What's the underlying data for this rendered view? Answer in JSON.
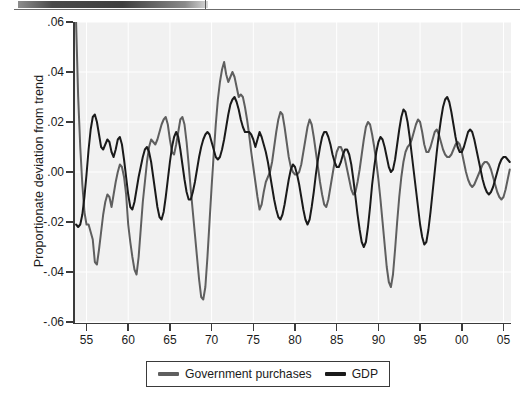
{
  "figure": {
    "ylabel": "Proportionate deviation from trend",
    "plot_bg": "#f1f1f1",
    "gridline_color": "#ffffff",
    "axis_color": "#3a3a3a"
  },
  "legend": {
    "items": [
      {
        "label": "Government purchases",
        "color": "#5f5f5f",
        "swatch_name": "legend-swatch-government-purchases"
      },
      {
        "label": "GDP",
        "color": "#1a1a1a",
        "swatch_name": "legend-swatch-gdp"
      }
    ]
  },
  "chart_data": {
    "type": "line",
    "title": "",
    "subtitle": "",
    "xlabel": "",
    "ylabel": "Proportionate deviation from trend",
    "xlim": [
      1953.5,
      2005.9
    ],
    "ylim": [
      -0.06,
      0.06
    ],
    "grid": true,
    "legend_position": "bottom-center",
    "xtick_labels": [
      "55",
      "60",
      "65",
      "70",
      "75",
      "80",
      "85",
      "90",
      "95",
      "00",
      "05"
    ],
    "xtick_values": [
      1955,
      1960,
      1965,
      1970,
      1975,
      1980,
      1985,
      1990,
      1995,
      2000,
      2005
    ],
    "ytick_labels": [
      ".06",
      ".04",
      ".02",
      ".00",
      "-.02",
      "-.04",
      "-.06"
    ],
    "ytick_values": [
      0.06,
      0.04,
      0.02,
      0.0,
      -0.02,
      -0.04,
      -0.06
    ],
    "x_start": 1953.75,
    "x_step": 0.25,
    "series": [
      {
        "name": "Government purchases",
        "color": "#5f5f5f",
        "linewidth": 2.0,
        "values": [
          0.06,
          0.03,
          0.01,
          -0.005,
          -0.016,
          -0.021,
          -0.021,
          -0.024,
          -0.027,
          -0.036,
          -0.037,
          -0.031,
          -0.024,
          -0.017,
          -0.012,
          -0.009,
          -0.01,
          -0.014,
          -0.009,
          -0.004,
          0.0,
          0.003,
          0.002,
          -0.002,
          -0.009,
          -0.021,
          -0.028,
          -0.034,
          -0.039,
          -0.041,
          -0.034,
          -0.023,
          -0.012,
          -0.004,
          0.004,
          0.01,
          0.013,
          0.012,
          0.011,
          0.013,
          0.016,
          0.019,
          0.021,
          0.022,
          0.019,
          0.013,
          0.008,
          0.007,
          0.011,
          0.016,
          0.021,
          0.022,
          0.019,
          0.012,
          0.003,
          -0.007,
          -0.016,
          -0.025,
          -0.034,
          -0.043,
          -0.05,
          -0.051,
          -0.046,
          -0.034,
          -0.02,
          -0.006,
          0.007,
          0.019,
          0.029,
          0.036,
          0.041,
          0.044,
          0.039,
          0.036,
          0.038,
          0.04,
          0.038,
          0.034,
          0.03,
          0.031,
          0.03,
          0.026,
          0.021,
          0.015,
          0.008,
          0.002,
          -0.004,
          -0.01,
          -0.015,
          -0.013,
          -0.008,
          -0.004,
          -0.002,
          0.0,
          0.004,
          0.01,
          0.016,
          0.021,
          0.024,
          0.023,
          0.018,
          0.012,
          0.006,
          0.002,
          0.0,
          -0.001,
          -0.001,
          0.0,
          0.003,
          0.008,
          0.013,
          0.018,
          0.021,
          0.019,
          0.014,
          0.008,
          0.002,
          -0.004,
          -0.009,
          -0.013,
          -0.014,
          -0.011,
          -0.006,
          -0.001,
          0.004,
          0.008,
          0.01,
          0.01,
          0.008,
          0.005,
          0.001,
          -0.003,
          -0.007,
          -0.009,
          -0.008,
          -0.004,
          0.001,
          0.007,
          0.013,
          0.018,
          0.02,
          0.019,
          0.015,
          0.01,
          0.004,
          -0.003,
          -0.011,
          -0.02,
          -0.029,
          -0.038,
          -0.044,
          -0.046,
          -0.041,
          -0.031,
          -0.02,
          -0.01,
          -0.002,
          0.004,
          0.008,
          0.01,
          0.011,
          0.013,
          0.016,
          0.019,
          0.021,
          0.02,
          0.016,
          0.011,
          0.008,
          0.008,
          0.01,
          0.013,
          0.016,
          0.017,
          0.015,
          0.012,
          0.009,
          0.007,
          0.006,
          0.006,
          0.007,
          0.009,
          0.011,
          0.012,
          0.011,
          0.008,
          0.004,
          0.0,
          -0.003,
          -0.005,
          -0.006,
          -0.005,
          -0.003,
          -0.001,
          0.001,
          0.003,
          0.004,
          0.004,
          0.003,
          0.001,
          -0.002,
          -0.005,
          -0.008,
          -0.01,
          -0.011,
          -0.01,
          -0.007,
          -0.003,
          0.001,
          0.004,
          0.006,
          0.007,
          0.007,
          0.006,
          0.004,
          0.002,
          0.001,
          0.001,
          0.003,
          0.006,
          0.01,
          0.015,
          0.019,
          0.022,
          0.023,
          0.021,
          0.017,
          0.011,
          0.004,
          -0.003,
          -0.009,
          -0.013,
          -0.015,
          -0.013,
          -0.009,
          -0.004,
          0.0,
          0.002,
          0.002,
          0.0,
          -0.003,
          -0.006,
          -0.009,
          -0.01,
          -0.01,
          -0.008,
          -0.006,
          -0.005
        ]
      },
      {
        "name": "GDP",
        "color": "#1a1a1a",
        "linewidth": 2.0,
        "values": [
          -0.021,
          -0.022,
          -0.021,
          -0.017,
          -0.01,
          -0.001,
          0.009,
          0.017,
          0.022,
          0.023,
          0.02,
          0.015,
          0.01,
          0.009,
          0.011,
          0.013,
          0.012,
          0.008,
          0.006,
          0.009,
          0.013,
          0.014,
          0.011,
          0.005,
          -0.002,
          -0.009,
          -0.014,
          -0.015,
          -0.012,
          -0.007,
          -0.002,
          0.002,
          0.006,
          0.009,
          0.01,
          0.008,
          0.004,
          -0.002,
          -0.008,
          -0.014,
          -0.018,
          -0.019,
          -0.016,
          -0.01,
          -0.003,
          0.004,
          0.01,
          0.014,
          0.016,
          0.014,
          0.009,
          0.003,
          -0.003,
          -0.008,
          -0.011,
          -0.011,
          -0.008,
          -0.004,
          0.001,
          0.006,
          0.01,
          0.013,
          0.015,
          0.016,
          0.015,
          0.012,
          0.009,
          0.006,
          0.005,
          0.006,
          0.009,
          0.013,
          0.018,
          0.023,
          0.027,
          0.029,
          0.03,
          0.028,
          0.025,
          0.021,
          0.018,
          0.016,
          0.016,
          0.016,
          0.015,
          0.013,
          0.01,
          0.013,
          0.016,
          0.014,
          0.011,
          0.008,
          0.004,
          -0.001,
          -0.006,
          -0.011,
          -0.015,
          -0.018,
          -0.019,
          -0.017,
          -0.013,
          -0.008,
          -0.003,
          0.001,
          0.003,
          0.002,
          -0.001,
          -0.005,
          -0.01,
          -0.015,
          -0.019,
          -0.021,
          -0.019,
          -0.014,
          -0.008,
          -0.001,
          0.005,
          0.01,
          0.014,
          0.016,
          0.016,
          0.014,
          0.011,
          0.007,
          0.004,
          0.002,
          0.002,
          0.004,
          0.007,
          0.009,
          0.009,
          0.007,
          0.003,
          -0.003,
          -0.01,
          -0.017,
          -0.023,
          -0.028,
          -0.03,
          -0.028,
          -0.022,
          -0.014,
          -0.005,
          0.002,
          0.008,
          0.012,
          0.014,
          0.013,
          0.01,
          0.006,
          0.002,
          0.0,
          0.001,
          0.005,
          0.011,
          0.017,
          0.022,
          0.025,
          0.024,
          0.02,
          0.014,
          0.007,
          0.0,
          -0.007,
          -0.014,
          -0.021,
          -0.026,
          -0.029,
          -0.028,
          -0.023,
          -0.016,
          -0.008,
          0.0,
          0.008,
          0.015,
          0.021,
          0.026,
          0.029,
          0.03,
          0.028,
          0.024,
          0.019,
          0.014,
          0.01,
          0.008,
          0.008,
          0.01,
          0.013,
          0.016,
          0.017,
          0.016,
          0.013,
          0.009,
          0.005,
          0.001,
          -0.003,
          -0.006,
          -0.008,
          -0.009,
          -0.008,
          -0.006,
          -0.003,
          0.0,
          0.003,
          0.005,
          0.006,
          0.006,
          0.005,
          0.004,
          0.003,
          0.003,
          0.004,
          0.006,
          0.008,
          0.01,
          0.011,
          0.011,
          0.01,
          0.008,
          0.006,
          0.005,
          0.006,
          0.008,
          0.011,
          0.014,
          0.016,
          0.017,
          0.016,
          0.013,
          0.009,
          0.004,
          -0.001,
          -0.006,
          -0.01,
          -0.012,
          -0.012,
          -0.01,
          -0.007,
          -0.003,
          0.0,
          0.003,
          0.006,
          0.008,
          0.01,
          0.01,
          0.009,
          0.008,
          0.007
        ]
      }
    ]
  }
}
